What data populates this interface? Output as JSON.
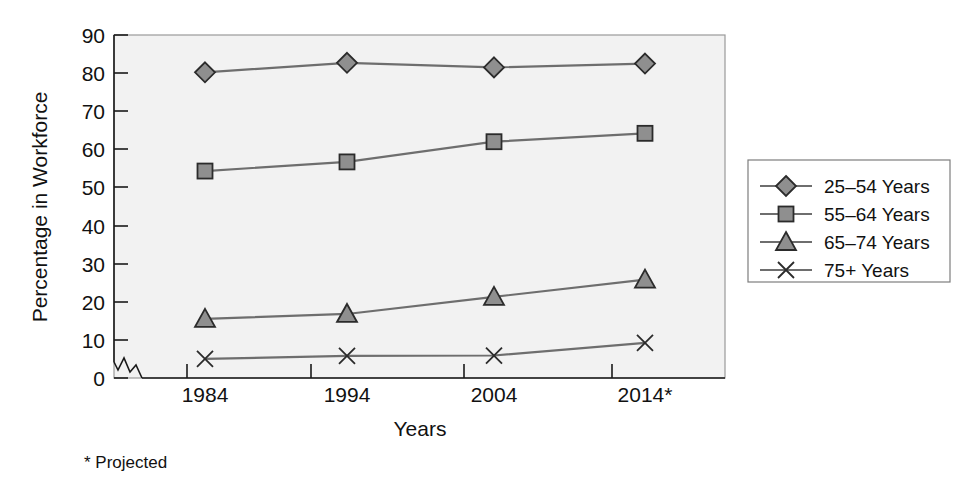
{
  "chart_data": {
    "type": "line",
    "title": "",
    "xlabel": "Years",
    "ylabel": "Percentage in Workforce",
    "categories": [
      "1984",
      "1994",
      "2004",
      "2014*"
    ],
    "x_tick_labels": [
      "1984",
      "1994",
      "2004",
      "2014*"
    ],
    "y_tick_labels": [
      "0",
      "10",
      "20",
      "30",
      "40",
      "50",
      "60",
      "70",
      "80",
      "90"
    ],
    "y_ticks": [
      0,
      10,
      20,
      30,
      40,
      50,
      60,
      70,
      80,
      90
    ],
    "ylim": [
      0,
      90
    ],
    "grid": false,
    "axis_break": true,
    "legend_position": "right",
    "footnote": "* Projected",
    "series": [
      {
        "name": "25–54 Years",
        "marker": "diamond",
        "values": [
          80.2,
          82.7,
          81.5,
          82.5
        ]
      },
      {
        "name": "55–64 Years",
        "marker": "square",
        "values": [
          54.3,
          56.7,
          62.0,
          64.2
        ]
      },
      {
        "name": "65–74 Years",
        "marker": "triangle",
        "values": [
          15.5,
          16.8,
          21.3,
          25.8
        ]
      },
      {
        "name": "75+ Years",
        "marker": "cross",
        "values": [
          5.0,
          5.8,
          5.9,
          9.2
        ]
      }
    ]
  },
  "colors": {
    "plot_background": "#f2f2f2",
    "axis": "#1a1a1a",
    "frame": "#9a9a9a",
    "marker_fill": "#8f8f8f",
    "marker_stroke": "#2b2b2b",
    "line": "#6e6e6e",
    "text": "#111111"
  },
  "legend": {
    "items": [
      {
        "label": "25–54 Years",
        "marker": "diamond"
      },
      {
        "label": "55–64 Years",
        "marker": "square"
      },
      {
        "label": "65–74 Years",
        "marker": "triangle"
      },
      {
        "label": "75+ Years",
        "marker": "cross"
      }
    ]
  },
  "labels": {
    "y_axis_title": "Percentage in Workforce",
    "x_axis_title": "Years",
    "footnote": "* Projected"
  }
}
